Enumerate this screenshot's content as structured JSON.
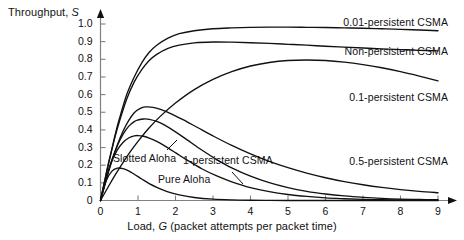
{
  "chart_data": {
    "type": "line",
    "title": "",
    "xlabel": "Load, G (packet attempts per packet time)",
    "xlabel_prefix": "Load, ",
    "xlabel_var": "G",
    "xlabel_suffix": " (packet attempts per packet time)",
    "ylabel": "Throughput, S",
    "ylabel_prefix": "Throughput, ",
    "ylabel_var": "S",
    "xlim": [
      0,
      9
    ],
    "ylim": [
      0,
      1.0
    ],
    "grid": false,
    "legend_position": "inline-annotations",
    "xticks": [
      "0",
      "1",
      "2",
      "3",
      "4",
      "5",
      "6",
      "7",
      "8",
      "9"
    ],
    "xtick_values": [
      0,
      1,
      2,
      3,
      4,
      5,
      6,
      7,
      8,
      9
    ],
    "yticks": [
      "0",
      "0.1",
      "0.2",
      "0.3",
      "0.4",
      "0.5",
      "0.6",
      "0.7",
      "0.8",
      "0.9",
      "1.0"
    ],
    "ytick_values": [
      0,
      0.1,
      0.2,
      0.3,
      0.4,
      0.5,
      0.6,
      0.7,
      0.8,
      0.9,
      1.0
    ],
    "line_color": "#111111",
    "axis_color": "#808080",
    "series": [
      {
        "name": "0.01-persistent CSMA",
        "label_x": 9.0,
        "label_y": 1.02,
        "x": [
          0,
          0.1,
          0.2,
          0.3,
          0.4,
          0.5,
          0.7,
          0.9,
          1.1,
          1.3,
          1.5,
          1.8,
          2.1,
          2.5,
          3.0,
          3.5,
          4.0,
          4.5,
          5.0,
          5.5,
          6.0,
          6.5,
          7.0,
          7.5,
          8.0,
          8.5,
          9.0
        ],
        "values": [
          0.0,
          0.1,
          0.2,
          0.29,
          0.38,
          0.46,
          0.6,
          0.7,
          0.78,
          0.84,
          0.88,
          0.92,
          0.945,
          0.962,
          0.973,
          0.978,
          0.981,
          0.982,
          0.982,
          0.981,
          0.98,
          0.978,
          0.976,
          0.973,
          0.97,
          0.966,
          0.962
        ]
      },
      {
        "name": "Non-persistent CSMA",
        "label_x": 9.0,
        "label_y": 0.855,
        "x": [
          0,
          0.1,
          0.2,
          0.3,
          0.4,
          0.5,
          0.7,
          0.9,
          1.1,
          1.3,
          1.5,
          1.8,
          2.1,
          2.5,
          3.0,
          3.5,
          4.0,
          4.5,
          5.0,
          5.5,
          6.0,
          6.5,
          7.0,
          7.5,
          8.0,
          8.5,
          9.0
        ],
        "values": [
          0.0,
          0.1,
          0.195,
          0.285,
          0.37,
          0.445,
          0.575,
          0.672,
          0.742,
          0.793,
          0.828,
          0.862,
          0.88,
          0.893,
          0.898,
          0.897,
          0.894,
          0.89,
          0.885,
          0.88,
          0.874,
          0.869,
          0.864,
          0.859,
          0.855,
          0.851,
          0.848
        ]
      },
      {
        "name": "0.1-persistent CSMA",
        "label_x": 9.0,
        "label_y": 0.615,
        "x": [
          0,
          0.2,
          0.4,
          0.6,
          0.8,
          1.0,
          1.3,
          1.6,
          2.0,
          2.5,
          3.0,
          3.5,
          4.0,
          4.5,
          5.0,
          5.5,
          6.0,
          6.5,
          7.0,
          7.5,
          8.0,
          8.5,
          9.0
        ],
        "values": [
          0.0,
          0.075,
          0.148,
          0.215,
          0.278,
          0.335,
          0.412,
          0.478,
          0.552,
          0.628,
          0.686,
          0.73,
          0.762,
          0.782,
          0.793,
          0.796,
          0.793,
          0.784,
          0.77,
          0.752,
          0.73,
          0.705,
          0.678
        ]
      },
      {
        "name": "0.5-persistent CSMA",
        "label_x": 9.0,
        "label_y": 0.215,
        "x": [
          0,
          0.15,
          0.3,
          0.45,
          0.6,
          0.75,
          0.9,
          1.05,
          1.2,
          1.4,
          1.6,
          1.9,
          2.2,
          2.6,
          3.0,
          3.5,
          4.0,
          4.5,
          5.0,
          5.5,
          6.0,
          6.5,
          7.0,
          7.5,
          8.0,
          8.5,
          9.0
        ],
        "values": [
          0.0,
          0.115,
          0.222,
          0.315,
          0.392,
          0.452,
          0.497,
          0.52,
          0.53,
          0.528,
          0.516,
          0.49,
          0.458,
          0.412,
          0.366,
          0.312,
          0.264,
          0.222,
          0.186,
          0.155,
          0.129,
          0.107,
          0.089,
          0.074,
          0.062,
          0.052,
          0.044
        ]
      },
      {
        "name": "1-persistent CSMA",
        "label_x": 3.2,
        "label_y": 0.185,
        "x": [
          0,
          0.15,
          0.3,
          0.45,
          0.6,
          0.75,
          0.9,
          1.0,
          1.15,
          1.3,
          1.5,
          1.7,
          2.0,
          2.3,
          2.7,
          3.1,
          3.5,
          4.0,
          4.5,
          5.0,
          5.5,
          6.0,
          6.5,
          7.0,
          7.5,
          8.0,
          8.5,
          9.0
        ],
        "values": [
          0.0,
          0.122,
          0.228,
          0.312,
          0.375,
          0.42,
          0.447,
          0.456,
          0.462,
          0.46,
          0.448,
          0.428,
          0.389,
          0.345,
          0.286,
          0.232,
          0.185,
          0.138,
          0.101,
          0.073,
          0.052,
          0.037,
          0.026,
          0.018,
          0.012,
          0.008,
          0.006,
          0.004
        ]
      },
      {
        "name": "Slotted Aloha",
        "label_x": 1.5,
        "label_y": 0.255,
        "x": [
          0,
          0.15,
          0.3,
          0.45,
          0.6,
          0.75,
          0.9,
          1.0,
          1.15,
          1.3,
          1.5,
          1.7,
          2.0,
          2.3,
          2.7,
          3.1,
          3.5,
          4.0,
          4.5,
          5.0,
          5.5,
          6.0,
          6.5,
          7.0,
          7.5,
          8.0,
          8.5,
          9.0
        ],
        "values": [
          0.0,
          0.129,
          0.222,
          0.287,
          0.329,
          0.354,
          0.366,
          0.368,
          0.364,
          0.354,
          0.335,
          0.311,
          0.271,
          0.23,
          0.18,
          0.139,
          0.106,
          0.073,
          0.05,
          0.034,
          0.023,
          0.015,
          0.01,
          0.006,
          0.004,
          0.003,
          0.002,
          0.001
        ]
      },
      {
        "name": "Pure Aloha",
        "label_x": 2.2,
        "label_y": 0.145,
        "x": [
          0,
          0.15,
          0.3,
          0.45,
          0.6,
          0.75,
          0.9,
          1.1,
          1.3,
          1.5,
          1.8,
          2.1,
          2.5,
          3.0,
          3.5,
          4.0,
          4.5,
          5.0,
          5.5,
          6.0,
          6.5,
          7.0,
          7.5,
          8.0,
          8.5,
          9.0
        ],
        "values": [
          0.0,
          0.111,
          0.165,
          0.183,
          0.181,
          0.168,
          0.149,
          0.122,
          0.096,
          0.075,
          0.049,
          0.032,
          0.017,
          0.0074,
          0.0032,
          0.0013,
          0.0006,
          0.0002,
          0.0001,
          0.0,
          0.0,
          0.0,
          0.0,
          0.0,
          0.0,
          0.0
        ]
      }
    ],
    "annotations": [
      {
        "text": "0.01-persistent CSMA",
        "x": 9.0,
        "y": 1.03
      },
      {
        "text": "Non-persistent CSMA",
        "x": 9.0,
        "y": 0.855
      },
      {
        "text": "0.1-persistent CSMA",
        "x": 9.0,
        "y": 0.615
      },
      {
        "text": "0.5-persistent CSMA",
        "x": 9.0,
        "y": 0.215
      },
      {
        "text": "1-persistent CSMA",
        "x": 3.3,
        "y": 0.185
      },
      {
        "text": "Slotted Aloha",
        "x": 1.4,
        "y": 0.21
      },
      {
        "text": "Pure Aloha",
        "x": 2.45,
        "y": 0.135
      }
    ]
  }
}
